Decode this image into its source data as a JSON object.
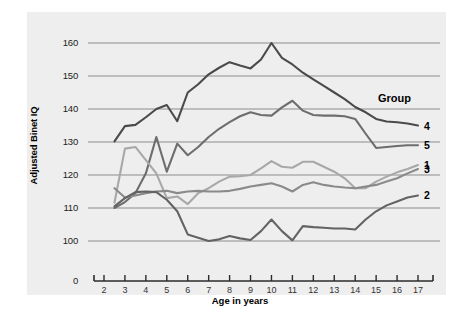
{
  "chart_data": {
    "type": "line",
    "title": "",
    "xlabel": "Age in years",
    "ylabel": "Adjusted Binet IQ",
    "xlim": [
      1.4,
      17.9
    ],
    "ylim": [
      96,
      164
    ],
    "yticks": [
      0,
      100,
      110,
      120,
      130,
      140,
      150,
      160
    ],
    "ytick_labels": [
      "0",
      "100",
      "110",
      "120",
      "130",
      "140",
      "150",
      "160"
    ],
    "y_axis_break": true,
    "xticks": [
      2,
      3,
      4,
      5,
      6,
      7,
      8,
      9,
      10,
      11,
      12,
      13,
      14,
      15,
      16,
      17
    ],
    "xtick_labels": [
      "2",
      "3",
      "4",
      "5",
      "6",
      "7",
      "8",
      "9",
      "10",
      "11",
      "12",
      "13",
      "14",
      "15",
      "16",
      "17"
    ],
    "grid": "horizontal",
    "legend_title": "Group",
    "legend_position": "right-inline",
    "series": [
      {
        "name": "4",
        "color": "#4a4a4a",
        "label": "4",
        "x": [
          2.5,
          3.0,
          3.5,
          4.0,
          4.5,
          5.0,
          5.5,
          6.0,
          6.5,
          7.0,
          7.5,
          8.0,
          8.5,
          9.0,
          9.5,
          10.0,
          10.5,
          11.0,
          11.5,
          12.0,
          12.5,
          13.0,
          13.5,
          14.0,
          14.5,
          15.0,
          15.5,
          16.0,
          16.5,
          17.0
        ],
        "y": [
          130.2,
          134.8,
          135.2,
          137.5,
          140.0,
          141.2,
          136.3,
          145.0,
          147.5,
          150.5,
          152.5,
          154.2,
          153.2,
          152.3,
          155.0,
          160.0,
          155.5,
          153.5,
          151.0,
          149.0,
          147.0,
          145.0,
          143.0,
          140.6,
          139.0,
          137.0,
          136.2,
          136.0,
          135.6,
          135.0
        ]
      },
      {
        "name": "5",
        "color": "#6d6d6d",
        "label": "5",
        "x": [
          2.5,
          3.0,
          3.5,
          4.0,
          4.5,
          5.0,
          5.5,
          6.0,
          6.5,
          7.0,
          7.5,
          8.0,
          8.5,
          9.0,
          9.5,
          10.0,
          10.5,
          11.0,
          11.5,
          12.0,
          12.5,
          13.0,
          13.5,
          14.0,
          14.5,
          15.0,
          15.5,
          16.0,
          16.5,
          17.0
        ],
        "y": [
          110.0,
          111.8,
          114.5,
          120.5,
          131.5,
          121.0,
          129.5,
          126.0,
          128.5,
          131.5,
          134.0,
          136.0,
          137.8,
          139.0,
          138.2,
          138.0,
          140.5,
          142.5,
          139.5,
          138.2,
          138.0,
          138.0,
          137.8,
          137.0,
          132.5,
          128.2,
          128.5,
          128.8,
          129.0,
          129.0
        ]
      },
      {
        "name": "1",
        "color": "#a8a8a8",
        "label": "1",
        "x": [
          2.5,
          3.0,
          3.5,
          4.0,
          4.5,
          5.0,
          5.5,
          6.0,
          6.5,
          7.0,
          7.5,
          8.0,
          8.5,
          9.0,
          9.5,
          10.0,
          10.5,
          11.0,
          11.5,
          12.0,
          12.5,
          13.0,
          13.5,
          14.0,
          14.5,
          15.0,
          15.5,
          16.0,
          16.5,
          17.0
        ],
        "y": [
          111.6,
          128.0,
          128.5,
          124.5,
          120.5,
          113.0,
          113.5,
          111.2,
          114.5,
          116.0,
          118.0,
          119.5,
          119.6,
          120.0,
          122.0,
          124.2,
          122.5,
          122.2,
          124.0,
          124.0,
          122.5,
          121.0,
          119.0,
          116.0,
          116.0,
          118.0,
          119.5,
          120.8,
          121.8,
          123.0
        ]
      },
      {
        "name": "3",
        "color": "#8a8a8a",
        "label": "3",
        "x": [
          2.5,
          3.0,
          3.5,
          4.0,
          4.5,
          5.0,
          5.5,
          6.0,
          6.5,
          7.0,
          7.5,
          8.0,
          8.5,
          9.0,
          9.5,
          10.0,
          10.5,
          11.0,
          11.5,
          12.0,
          12.5,
          13.0,
          13.5,
          14.0,
          14.5,
          15.0,
          15.5,
          16.0,
          16.5,
          17.0
        ],
        "y": [
          116.0,
          113.2,
          113.8,
          114.5,
          115.0,
          115.2,
          114.5,
          115.0,
          115.2,
          115.0,
          115.0,
          115.2,
          115.8,
          116.5,
          117.0,
          117.5,
          116.5,
          115.0,
          117.0,
          117.8,
          117.0,
          116.5,
          116.2,
          116.0,
          116.5,
          117.0,
          118.0,
          119.0,
          120.5,
          121.8
        ]
      },
      {
        "name": "2",
        "color": "#636363",
        "label": "2",
        "x": [
          2.5,
          3.0,
          3.5,
          4.0,
          4.5,
          5.0,
          5.5,
          6.0,
          6.5,
          7.0,
          7.5,
          8.0,
          8.5,
          9.0,
          9.5,
          10.0,
          10.5,
          11.0,
          11.5,
          12.0,
          12.5,
          13.0,
          13.5,
          14.0,
          14.5,
          15.0,
          15.5,
          16.0,
          16.5,
          17.0
        ],
        "y": [
          110.5,
          113.0,
          114.8,
          115.0,
          114.8,
          112.5,
          109.0,
          102.0,
          101.0,
          100.0,
          100.5,
          101.5,
          100.8,
          100.3,
          103.0,
          106.5,
          103.0,
          100.2,
          104.5,
          104.2,
          104.0,
          103.8,
          103.8,
          103.5,
          106.5,
          109.0,
          110.8,
          112.0,
          113.2,
          113.8
        ]
      }
    ]
  }
}
